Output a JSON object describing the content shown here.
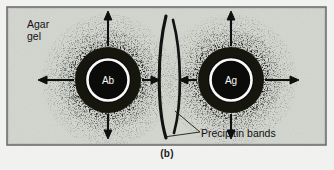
{
  "figure": {
    "caption": "(b)",
    "panel_letter": "(b)",
    "technique": "double immunodiffusion",
    "background_color": "#d7dad3",
    "border_color": "#5d6160",
    "ink_color": "#111111",
    "labels": {
      "agar_line1": "Agar",
      "agar_line2": "gel",
      "precipitin": "Precipitin bands"
    },
    "wells": [
      {
        "id": "antibody-well",
        "label": "Ab",
        "cx": 108,
        "cy": 80,
        "r": 22
      },
      {
        "id": "antigen-well",
        "label": "Ag",
        "cx": 231,
        "cy": 80,
        "r": 22
      }
    ],
    "diffusion_arrows": [
      {
        "well": "Ab",
        "direction": "up"
      },
      {
        "well": "Ab",
        "direction": "down"
      },
      {
        "well": "Ab",
        "direction": "left"
      },
      {
        "well": "Ab",
        "direction": "right"
      },
      {
        "well": "Ag",
        "direction": "up"
      },
      {
        "well": "Ag",
        "direction": "down"
      },
      {
        "well": "Ag",
        "direction": "left"
      },
      {
        "well": "Ag",
        "direction": "right"
      }
    ],
    "precipitin_bands": [
      {
        "id": "band-left",
        "bow": "left"
      },
      {
        "id": "band-right",
        "bow": "right"
      }
    ]
  }
}
